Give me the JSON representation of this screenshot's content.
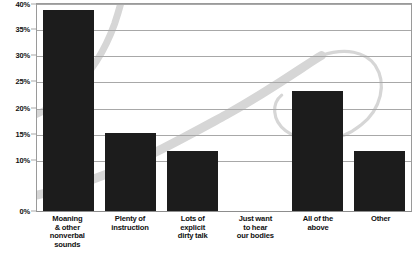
{
  "chart_data": {
    "type": "bar",
    "title": "",
    "subtitle": "",
    "xlabel": "",
    "ylabel": "",
    "ylim": [
      0,
      40
    ],
    "grid": true,
    "legend": false,
    "legend_position": "none",
    "orientation": "vertical",
    "bar_color": "#1c1c1c",
    "categories": [
      "Moaning & other nonverbal sounds",
      "Plenty of instruction",
      "Lots of explicit dirty talk",
      "Just want to hear our bodies",
      "All of the above",
      "Other"
    ],
    "category_lines": [
      [
        "Moaning",
        "& other",
        "nonverbal",
        "sounds"
      ],
      [
        "Plenty of",
        "instruction"
      ],
      [
        "Lots of",
        "explicit",
        "dirty talk"
      ],
      [
        "Just want",
        "to hear",
        "our bodies"
      ],
      [
        "All of the",
        "above"
      ],
      [
        "Other"
      ]
    ],
    "values": [
      38.5,
      15,
      11.5,
      0,
      23,
      11.5
    ],
    "ytick_values": [
      40,
      35,
      30,
      25,
      20,
      15,
      10,
      0
    ],
    "ytick_labels": [
      "40%",
      "35%",
      "30%",
      "25%",
      "20%",
      "15%",
      "10%",
      "0%"
    ]
  },
  "style": {
    "background": "#ffffff",
    "gridline_color": "#a8a8a8",
    "axis_color": "#8d8d8d",
    "text_color": "#111111",
    "swash_color": "#d8d8d8"
  }
}
